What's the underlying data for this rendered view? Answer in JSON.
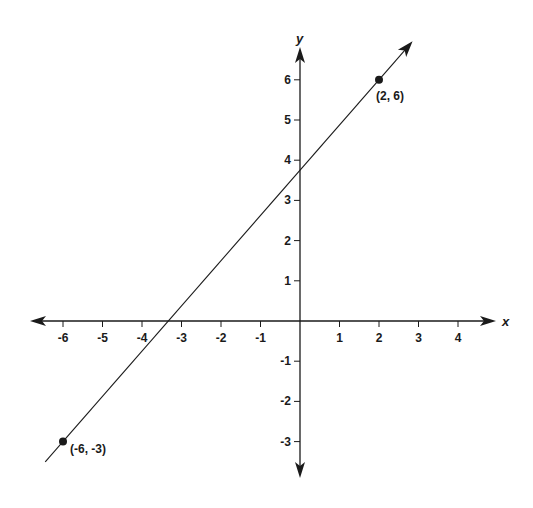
{
  "chart_data": {
    "type": "line",
    "title": "",
    "xlabel": "x",
    "ylabel": "y",
    "xlim": [
      -6.5,
      4.5
    ],
    "ylim": [
      -3.5,
      6.5
    ],
    "grid": false,
    "x_ticks": [
      -6,
      -5,
      -4,
      -3,
      -2,
      -1,
      1,
      2,
      3,
      4
    ],
    "y_ticks": [
      -3,
      -2,
      -1,
      1,
      2,
      3,
      4,
      5,
      6
    ],
    "series": [
      {
        "name": "line through (-6, -3) and (2, 6)",
        "x": [
          -6,
          2
        ],
        "y": [
          -3,
          6
        ],
        "slope": 1.125,
        "y_intercept": 3.75,
        "x_intercept": -3.33
      }
    ],
    "points": [
      {
        "x": -6,
        "y": -3,
        "label": "(-6, -3)"
      },
      {
        "x": 2,
        "y": 6,
        "label": "(2, 6)"
      }
    ]
  },
  "colors": {
    "ink": "#1a1a1a",
    "background": "#ffffff"
  }
}
